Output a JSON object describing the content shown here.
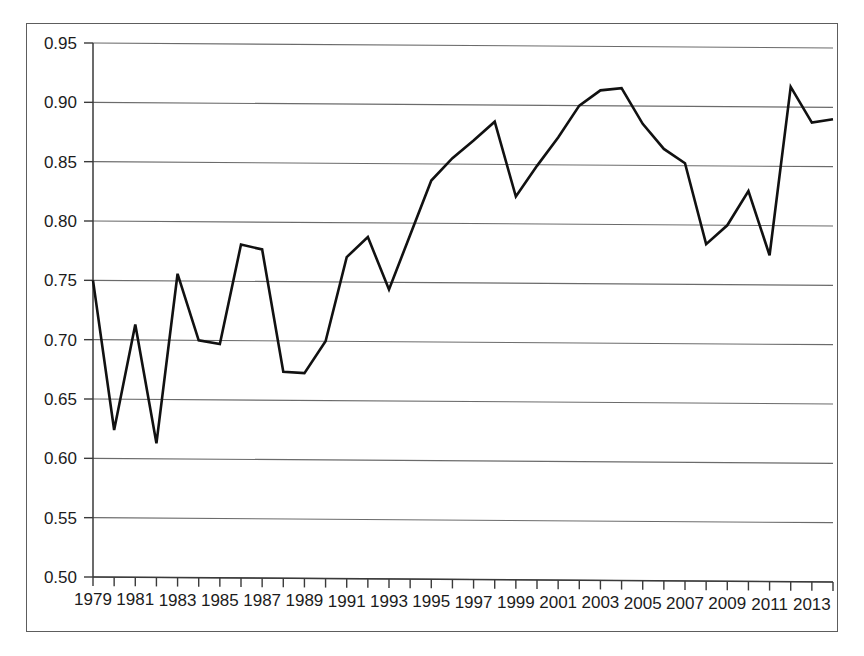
{
  "chart_data": {
    "type": "line",
    "title": "",
    "subtitle": "",
    "xlabel": "",
    "ylabel": "",
    "xlim": [
      1979,
      2014
    ],
    "ylim": [
      0.5,
      0.95
    ],
    "grid": "horizontal",
    "legend": "none",
    "y_ticks": [
      "0.50",
      "0.55",
      "0.60",
      "0.65",
      "0.70",
      "0.75",
      "0.80",
      "0.85",
      "0.90",
      "0.95"
    ],
    "y_tick_values": [
      0.5,
      0.55,
      0.6,
      0.65,
      0.7,
      0.75,
      0.8,
      0.85,
      0.9,
      0.95
    ],
    "x_tick_values": [
      1979,
      1980,
      1981,
      1982,
      1983,
      1984,
      1985,
      1986,
      1987,
      1988,
      1989,
      1990,
      1991,
      1992,
      1993,
      1994,
      1995,
      1996,
      1997,
      1998,
      1999,
      2000,
      2001,
      2002,
      2003,
      2004,
      2005,
      2006,
      2007,
      2008,
      2009,
      2010,
      2011,
      2012,
      2013,
      2014
    ],
    "x_tick_labels": [
      "1979",
      "",
      "1981",
      "",
      "1983",
      "",
      "1985",
      "",
      "1987",
      "",
      "1989",
      "",
      "1991",
      "",
      "1993",
      "",
      "1995",
      "",
      "1997",
      "",
      "1999",
      "",
      "2001",
      "",
      "2003",
      "",
      "2005",
      "",
      "2007",
      "",
      "2009",
      "",
      "2011",
      "",
      "2013",
      ""
    ],
    "x": [
      1979,
      1980,
      1981,
      1982,
      1983,
      1984,
      1985,
      1986,
      1987,
      1988,
      1989,
      1990,
      1991,
      1992,
      1993,
      1994,
      1995,
      1996,
      1997,
      1998,
      1999,
      2000,
      2001,
      2002,
      2003,
      2004,
      2005,
      2006,
      2007,
      2008,
      2009,
      2010,
      2011,
      2012,
      2013,
      2014
    ],
    "values": [
      0.75,
      0.624,
      0.713,
      0.613,
      0.756,
      0.7,
      0.697,
      0.781,
      0.777,
      0.674,
      0.673,
      0.7,
      0.771,
      0.788,
      0.744,
      0.79,
      0.836,
      0.855,
      0.87,
      0.886,
      0.823,
      0.849,
      0.873,
      0.9,
      0.913,
      0.915,
      0.885,
      0.864,
      0.852,
      0.784,
      0.8,
      0.829,
      0.775,
      0.917,
      0.887,
      0.89
    ],
    "series_color": "#111111",
    "line_width": 2.6,
    "grid_color": "#6b6b6b",
    "axis_color": "#3a3a3a"
  }
}
